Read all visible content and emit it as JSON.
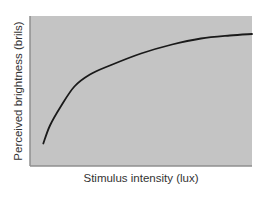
{
  "chart_data": {
    "type": "line",
    "title": "",
    "xlabel": "Stimulus intensity (lux)",
    "ylabel": "Perceived brightness (brils)",
    "grid": false,
    "legend": null,
    "xticks": [],
    "yticks": [],
    "xlim": [
      0,
      1
    ],
    "ylim": [
      0,
      1
    ],
    "series": [
      {
        "name": "brightness",
        "color": "#1a1a1a",
        "x": [
          0.06,
          0.09,
          0.14,
          0.2,
          0.27,
          0.36,
          0.5,
          0.64,
          0.77,
          0.9,
          1.0
        ],
        "y": [
          0.15,
          0.27,
          0.4,
          0.53,
          0.61,
          0.67,
          0.75,
          0.81,
          0.85,
          0.87,
          0.88
        ]
      }
    ]
  },
  "colors": {
    "plot_bg": "#c4c4c4",
    "axis": "#8f8f8f",
    "line": "#1a1a1a"
  }
}
